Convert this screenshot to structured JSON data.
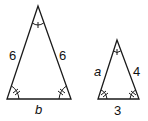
{
  "diagram": {
    "type": "similar-triangles",
    "triangles": [
      {
        "name": "large-triangle",
        "apex": [
          38,
          6
        ],
        "base_left": [
          7,
          99
        ],
        "base_right": [
          71,
          99
        ],
        "labels": {
          "left_side": "6",
          "right_side": "6",
          "base": "b"
        },
        "angle_marks": {
          "apex": "single-arc-one-tick",
          "base_left": "double-arc-two-ticks",
          "base_right": "double-arc-two-ticks"
        }
      },
      {
        "name": "small-triangle",
        "apex": [
          117,
          40
        ],
        "base_left": [
          98,
          99
        ],
        "base_right": [
          139,
          99
        ],
        "labels": {
          "left_side": "a",
          "right_side": "4",
          "base": "3"
        },
        "angle_marks": {
          "apex": "single-arc-one-tick",
          "base_left": "double-arc-two-ticks",
          "base_right": "double-arc-two-ticks"
        }
      }
    ],
    "stroke_color": "#1a1a1a"
  }
}
